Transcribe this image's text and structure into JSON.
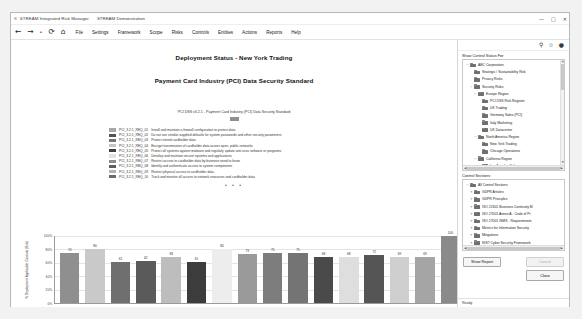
{
  "window": {
    "app_icon": "S",
    "title": "STREAM Integrated Risk Manager",
    "subtitle": "STREAM Demonstration",
    "minimize": "—",
    "maximize": "□",
    "close": "✕"
  },
  "nav": {
    "back": "←",
    "forward": "→",
    "stop": "•",
    "refresh": "⟳",
    "home": "⌂"
  },
  "menu": {
    "items": [
      {
        "label": "File"
      },
      {
        "label": "Settings"
      },
      {
        "label": "Framework"
      },
      {
        "label": "Scope"
      },
      {
        "label": "Risks"
      },
      {
        "label": "Controls"
      },
      {
        "label": "Entities"
      },
      {
        "label": "Actions"
      },
      {
        "label": "Reports"
      },
      {
        "label": "Help"
      }
    ]
  },
  "report": {
    "title": "Deployment Status - New York Trading",
    "subtitle": "Payment Card Industry (PCI) Data Security Standard",
    "legend_header": "PCI DSS v3.2.1 - Payment Card Industry (PCI) Data Security Standard",
    "ellipsis": "• • •",
    "legend": [
      {
        "code": "PCI_3.2.1_REQ_01",
        "text": "Install and maintain a firewall configuration to protect data",
        "color": "#a8a8a8"
      },
      {
        "code": "PCI_3.2.1_REQ_02",
        "text": "Do not use vendor-supplied defaults for system passwords and other security parameters",
        "color": "#545454"
      },
      {
        "code": "PCI_3.2.1_REQ_03",
        "text": "Protect stored cardholder data",
        "color": "#767676"
      },
      {
        "code": "PCI_3.2.1_REQ_04",
        "text": "Encrypt transmission of cardholder data across open, public networks",
        "color": "#c4c4c4"
      },
      {
        "code": "PCI_3.2.1_REQ_05",
        "text": "Protect all systems against malware and regularly update anti-virus software or programs",
        "color": "#3f3f3f"
      },
      {
        "code": "PCI_3.2.1_REQ_06",
        "text": "Develop and maintain secure systems and applications",
        "color": "#e2e2e2"
      },
      {
        "code": "PCI_3.2.1_REQ_07",
        "text": "Restrict access to cardholder data by business need to know",
        "color": "#8d8d8d"
      },
      {
        "code": "PCI_3.2.1_REQ_08",
        "text": "Identify and authenticate access to system components",
        "color": "#5e5e5e"
      },
      {
        "code": "PCI_3.2.1_REQ_09",
        "text": "Restrict physical access to cardholder data",
        "color": "#b2b2b2"
      },
      {
        "code": "PCI_3.2.1_REQ_10",
        "text": "Track and monitor all access to network resources and cardholder data",
        "color": "#6b6b6b"
      }
    ]
  },
  "chart_data": {
    "type": "bar",
    "title": "Deployment Status - New York Trading",
    "subtitle": "Payment Card Industry (PCI) Data Security Standard",
    "xlabel": "",
    "ylabel": "% Deployment Applicable Controls (Sub)",
    "ylim": [
      0,
      100
    ],
    "yticks": [
      "0%",
      "20%",
      "40%",
      "60%",
      "80%",
      "100%"
    ],
    "ytick_values": [
      0,
      20,
      40,
      60,
      80,
      100
    ],
    "grid": true,
    "legend_position": "above-plot",
    "categories": [
      "PCI_3.2.1_REQ_01",
      "PCI_3.2.1_REQ_02",
      "PCI_3.2.1_REQ_03",
      "PCI_3.2.1_REQ_04",
      "PCI_3.2.1_REQ_05",
      "PCI_3.2.1_REQ_06",
      "PCI_3.2.1_REQ_07",
      "PCI_3.2.1_REQ_08",
      "PCI_3.2.1_REQ_09",
      "PCI_3.2.1_REQ_10",
      "PCI_3.2.1_REQ_11",
      "PCI_3.2.1_REQ_12",
      "PCI_3.2.1_REQ_13",
      "PCI_3.2.1_REQ_14",
      "PCI_3.2.1_REQ_15",
      "Overall"
    ],
    "values": [
      74,
      80,
      61,
      62,
      68,
      61,
      80,
      73,
      75,
      75,
      68,
      68,
      72,
      69,
      69,
      100
    ],
    "bar_colors": [
      "#8f8f8f",
      "#c9c9c9",
      "#6f6f6f",
      "#5a5a5a",
      "#bdbdbd",
      "#3c3c3c",
      "#ededed",
      "#9a9a9a",
      "#7d7d7d",
      "#747474",
      "#4a4a4a",
      "#dedede",
      "#555555",
      "#cfcfcf",
      "#a5a5a5",
      "#8a8a8a"
    ]
  },
  "dock": {
    "tools": {
      "search": "⚲",
      "favorite": "☆",
      "user": "●"
    },
    "scope_label": "Show Control Status For:",
    "scope_tree": [
      {
        "indent": 0,
        "expander": "−",
        "label": "ABC Corporation"
      },
      {
        "indent": 1,
        "expander": "",
        "label": "Strategic / Sustainability Risk"
      },
      {
        "indent": 1,
        "expander": "",
        "label": "Privacy Risks"
      },
      {
        "indent": 1,
        "expander": "−",
        "label": "Security Risks"
      },
      {
        "indent": 2,
        "expander": "−",
        "label": "Europe Region"
      },
      {
        "indent": 3,
        "expander": "",
        "label": "PCI DSS Risk Register"
      },
      {
        "indent": 3,
        "expander": "",
        "label": "UK Trading"
      },
      {
        "indent": 3,
        "expander": "",
        "label": "Germany Sales (PCI)"
      },
      {
        "indent": 3,
        "expander": "",
        "label": "Italy Marketing"
      },
      {
        "indent": 3,
        "expander": "",
        "label": "UK Datacentre"
      },
      {
        "indent": 2,
        "expander": "−",
        "label": "North America Region"
      },
      {
        "indent": 3,
        "expander": "",
        "label": "New York Trading"
      },
      {
        "indent": 3,
        "expander": "",
        "label": "Chicago Operations"
      },
      {
        "indent": 2,
        "expander": "−",
        "label": "California Region"
      },
      {
        "indent": 3,
        "expander": "",
        "label": "Los Angeles Sales"
      },
      {
        "indent": 3,
        "expander": "",
        "label": "San Francisco N"
      }
    ],
    "sections_label": "Control Sections:",
    "sections_tree": [
      {
        "indent": 0,
        "expander": "−",
        "label": "All Control Sections"
      },
      {
        "indent": 1,
        "expander": "+",
        "label": "GDPR Articles"
      },
      {
        "indent": 1,
        "expander": "+",
        "label": "GDPR Principles"
      },
      {
        "indent": 1,
        "expander": "+",
        "label": "ISO 22301 Business Continuity M"
      },
      {
        "indent": 1,
        "expander": "+",
        "label": "ISO 27001 Annex A - Code of Pr"
      },
      {
        "indent": 1,
        "expander": "+",
        "label": "ISO 27001 ISMS - Requirements"
      },
      {
        "indent": 1,
        "expander": "+",
        "label": "Metrics for Information Security"
      },
      {
        "indent": 1,
        "expander": "+",
        "label": "Mitigations"
      },
      {
        "indent": 1,
        "expander": "+",
        "label": "NIST Cyber Security Framework"
      },
      {
        "indent": 1,
        "expander": "+",
        "label": "Payment Card Industry (PCI) Da"
      },
      {
        "indent": 1,
        "expander": "+",
        "label": "PCI DSS Milestone Report"
      }
    ],
    "buttons": {
      "show_report": "Show Report",
      "cancel": "Cancel",
      "close": "Close"
    },
    "status": "Ready"
  }
}
